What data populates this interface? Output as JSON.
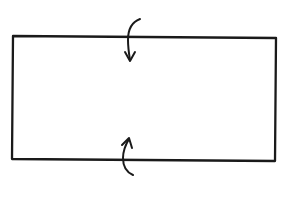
{
  "diagram": {
    "colors": {
      "background": "#ffffff",
      "stroke": "#1a1a1a"
    },
    "rectangle": {
      "corners": {
        "top_left": [
          13,
          36
        ],
        "top_right": [
          276,
          38
        ],
        "bottom_right": [
          275,
          161
        ],
        "bottom_left": [
          12,
          159
        ]
      }
    },
    "arrows": [
      {
        "id": "top-arrow",
        "direction": "down",
        "crosses": "top-edge"
      },
      {
        "id": "bottom-arrow",
        "direction": "up",
        "crosses": "bottom-edge"
      }
    ]
  }
}
